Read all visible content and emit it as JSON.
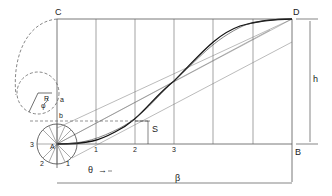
{
  "diagram": {
    "corner_labels": {
      "A": "A",
      "B": "B",
      "C": "C",
      "D": "D"
    },
    "point_labels": {
      "a": "a",
      "b": "b"
    },
    "division_labels": [
      "1",
      "2",
      "3"
    ],
    "circle_labels": [
      "1",
      "2",
      "3"
    ],
    "symbols": {
      "R": "R",
      "phi": "φ",
      "S": "S",
      "h": "h",
      "theta": "θ",
      "beta": "β"
    },
    "theta_arrow": "→",
    "colors": {
      "line": "#444444",
      "curve": "#111111",
      "text": "#222222"
    }
  }
}
